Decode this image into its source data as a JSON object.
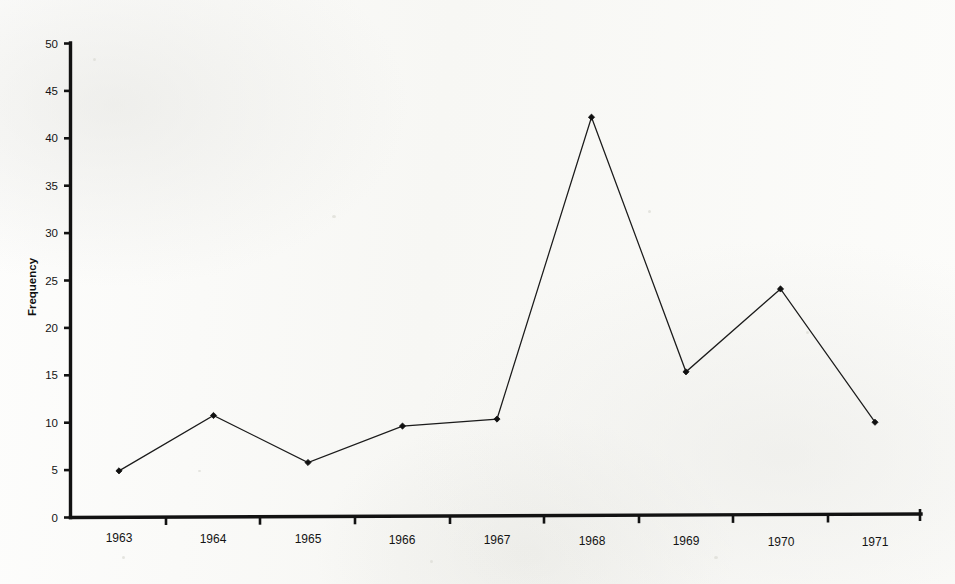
{
  "chart_data": {
    "type": "line",
    "title": "",
    "subtitle": "",
    "xlabel": "",
    "ylabel": "Frequency",
    "categories": [
      "1963",
      "1964",
      "1965",
      "1966",
      "1967",
      "1968",
      "1969",
      "1970",
      "1971"
    ],
    "values": [
      4.9,
      10.7,
      5.7,
      9.5,
      10.2,
      42.0,
      15.1,
      23.8,
      9.7
    ],
    "series": [
      {
        "name": "Frequency",
        "values": [
          4.9,
          10.7,
          5.7,
          9.5,
          10.2,
          42.0,
          15.1,
          23.8,
          9.7
        ]
      }
    ],
    "ylim": [
      0,
      50
    ],
    "ytick_labels": [
      "0",
      "5",
      "10",
      "15",
      "20",
      "25",
      "30",
      "35",
      "40",
      "45",
      "50"
    ],
    "ytick_values": [
      0,
      5,
      10,
      15,
      20,
      25,
      30,
      35,
      40,
      45,
      50
    ],
    "grid": false,
    "legend": false,
    "legend_position": "none",
    "marker": "diamond",
    "line_color": "#1b1b1b",
    "marker_color": "#101010",
    "axis_color": "#121212",
    "background_color": "#fbfbf9"
  },
  "axes": {
    "y_axis_title": "Frequency",
    "x_axis_title": ""
  }
}
